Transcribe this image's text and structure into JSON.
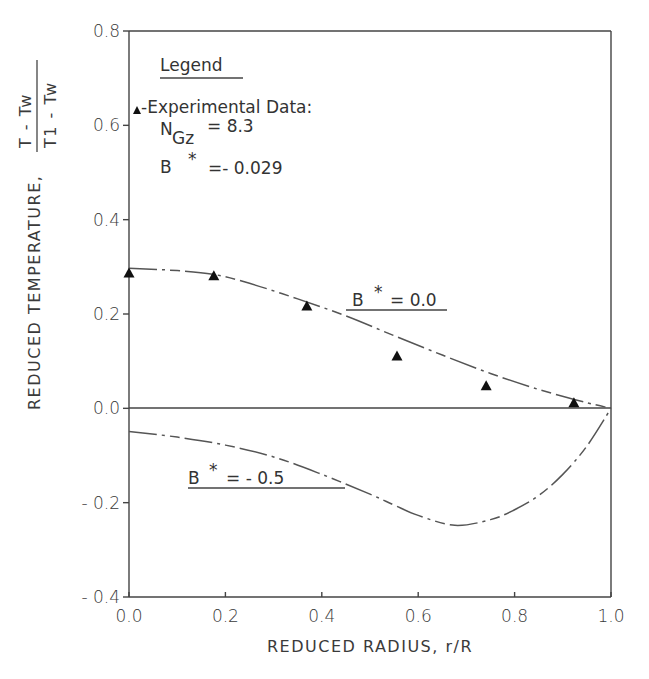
{
  "chart_data": {
    "type": "line",
    "title": "",
    "xlabel": "REDUCED  RADIUS, r/R",
    "ylabel": "REDUCED  TEMPERATURE,",
    "ylabel_fraction": {
      "numerator": "T  -  Tw",
      "denominator": "T1  -  Tw"
    },
    "xlim": [
      0.0,
      1.0
    ],
    "ylim": [
      -0.4,
      0.8
    ],
    "x_ticks": [
      "0.0",
      "0.2",
      "0.4",
      "0.6",
      "0.8",
      "1.0"
    ],
    "y_ticks": [
      "0.8",
      "0.6",
      "0.4",
      "0.2",
      "0.0",
      "-0.2",
      "-0.4"
    ],
    "grid": false,
    "zero_line": true,
    "legend": {
      "title": "Legend",
      "entry": "-Experimental Data:",
      "marker": "filled-triangle",
      "params": [
        {
          "name": "N",
          "subscript": "Gz",
          "value": "= 8.3"
        },
        {
          "name": "B",
          "superscript": "*",
          "value": "=- 0.029"
        }
      ],
      "position": "upper-left"
    },
    "series": [
      {
        "name": "Experimental Data",
        "style": "markers",
        "marker": "filled-triangle",
        "x": [
          0.0,
          0.176,
          0.369,
          0.556,
          0.741,
          0.923
        ],
        "y": [
          0.286,
          0.28,
          0.216,
          0.11,
          0.047,
          0.011
        ]
      },
      {
        "name": "B* = 0.0",
        "label": "B *= 0.0",
        "style": "dash-dot line",
        "x": [
          0.0,
          0.1,
          0.176,
          0.25,
          0.35,
          0.45,
          0.55,
          0.65,
          0.75,
          0.85,
          0.95,
          1.0
        ],
        "y": [
          0.297,
          0.292,
          0.284,
          0.265,
          0.232,
          0.196,
          0.154,
          0.113,
          0.074,
          0.04,
          0.012,
          0.0
        ]
      },
      {
        "name": "B* = -0.5",
        "label": "B *= - 0.5",
        "style": "dash-dot line",
        "x": [
          0.0,
          0.1,
          0.2,
          0.3,
          0.4,
          0.5,
          0.55,
          0.6,
          0.676,
          0.75,
          0.8,
          0.85,
          0.9,
          0.95,
          1.0
        ],
        "y": [
          -0.049,
          -0.061,
          -0.078,
          -0.103,
          -0.14,
          -0.182,
          -0.205,
          -0.227,
          -0.248,
          -0.236,
          -0.215,
          -0.185,
          -0.14,
          -0.08,
          0.0
        ]
      }
    ],
    "annotations": [
      {
        "text": "B *= 0.0",
        "x": 0.5,
        "y": 0.205
      },
      {
        "text": "B *= - 0.5",
        "x": 0.12,
        "y": -0.17
      }
    ]
  },
  "legend_labels": {
    "title": "Legend",
    "entry": "-Experimental Data:",
    "ngz_main": "N",
    "ngz_sub": "Gz",
    "ngz_value": "=  8.3",
    "bstar_main": "B",
    "bstar_sup": "*",
    "bstar_value": "=- 0.029"
  },
  "axis_labels": {
    "x": "REDUCED  RADIUS, r/R",
    "y": "REDUCED  TEMPERATURE,",
    "y_num": "T  -  Tw",
    "y_den": "T1  -  Tw"
  },
  "curve_labels": {
    "b0": "B",
    "b0_star": "*",
    "b0_value": "= 0.0",
    "bm05": "B",
    "bm05_star": "*",
    "bm05_value": "= - 0.5"
  },
  "colors": {
    "axis": "#444444",
    "curve": "#555555",
    "marker": "#111111",
    "background": "#ffffff"
  }
}
